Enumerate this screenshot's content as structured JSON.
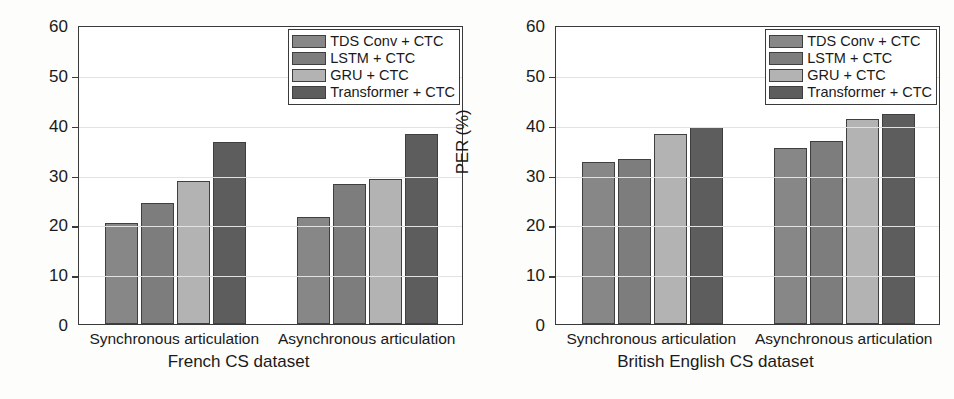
{
  "figure": {
    "background": "#fdfdfb",
    "panel_count": 2
  },
  "legend": {
    "entries": [
      {
        "label": "TDS Conv + CTC",
        "color": "#878787"
      },
      {
        "label": "LSTM + CTC",
        "color": "#7d7d7d"
      },
      {
        "label": "GRU + CTC",
        "color": "#b3b3b3"
      },
      {
        "label": "Transformer + CTC",
        "color": "#5d5d5d"
      }
    ]
  },
  "axis": {
    "ylabel": "PER (%)",
    "yticks": [
      0,
      10,
      20,
      30,
      40,
      50,
      60
    ],
    "ymin": 0,
    "ymax": 60
  },
  "categories": [
    "Synchronous articulation",
    "Asynchronous articulation"
  ],
  "panels": [
    {
      "id": "french",
      "xtitle": "French CS dataset"
    },
    {
      "id": "british-english",
      "xtitle": "British English CS dataset"
    }
  ],
  "chart_data": [
    {
      "type": "bar",
      "title": "French CS dataset",
      "xlabel": "French CS dataset",
      "ylabel": "PER (%)",
      "ylim": [
        0,
        60
      ],
      "yticks": [
        0,
        10,
        20,
        30,
        40,
        50,
        60
      ],
      "grid": true,
      "legend_position": "top-right",
      "categories": [
        "Synchronous articulation",
        "Asynchronous articulation"
      ],
      "series": [
        {
          "name": "TDS Conv + CTC",
          "color": "#878787",
          "values": [
            20.3,
            21.4
          ]
        },
        {
          "name": "LSTM + CTC",
          "color": "#7d7d7d",
          "values": [
            24.2,
            28.1
          ]
        },
        {
          "name": "GRU + CTC",
          "color": "#b3b3b3",
          "values": [
            28.7,
            29.2
          ]
        },
        {
          "name": "Transformer + CTC",
          "color": "#5d5d5d",
          "values": [
            36.5,
            38.1
          ]
        }
      ]
    },
    {
      "type": "bar",
      "title": "British English CS dataset",
      "xlabel": "British English CS dataset",
      "ylabel": "PER (%)",
      "ylim": [
        0,
        60
      ],
      "yticks": [
        0,
        10,
        20,
        30,
        40,
        50,
        60
      ],
      "grid": true,
      "legend_position": "top-right",
      "categories": [
        "Synchronous articulation",
        "Asynchronous articulation"
      ],
      "series": [
        {
          "name": "TDS Conv + CTC",
          "color": "#878787",
          "values": [
            32.5,
            35.4
          ]
        },
        {
          "name": "LSTM + CTC",
          "color": "#7d7d7d",
          "values": [
            33.2,
            36.8
          ]
        },
        {
          "name": "GRU + CTC",
          "color": "#b3b3b3",
          "values": [
            38.1,
            41.2
          ]
        },
        {
          "name": "Transformer + CTC",
          "color": "#5d5d5d",
          "values": [
            39.5,
            42.2
          ]
        }
      ]
    }
  ]
}
